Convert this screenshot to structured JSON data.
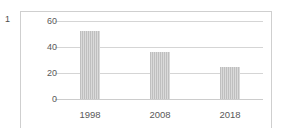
{
  "figure": {
    "number": "1"
  },
  "chart_data": {
    "type": "bar",
    "title": "",
    "subtitle": "",
    "xlabel": "",
    "ylabel": "",
    "categories": [
      "1998",
      "2008",
      "2018"
    ],
    "values": [
      52,
      36,
      25
    ],
    "series": [
      {
        "name": "",
        "values": [
          52,
          36,
          25
        ],
        "color": "#bfbfbf"
      }
    ],
    "ylim": [
      0,
      60
    ],
    "yticks": [
      0,
      20,
      40,
      60
    ],
    "ytick_labels": [
      "0",
      "20",
      "40",
      "60"
    ],
    "xtick_labels": [
      "1998",
      "2008",
      "2018"
    ],
    "grid": true,
    "grid_axis": "y",
    "legend": false,
    "legend_position": "none",
    "annotations": [],
    "colors": {
      "bar": "#bfbfbf",
      "gridline": "#d5d5d5",
      "axis_text": "#595959",
      "frame": "#cfcfcf",
      "background": "#ffffff"
    }
  }
}
